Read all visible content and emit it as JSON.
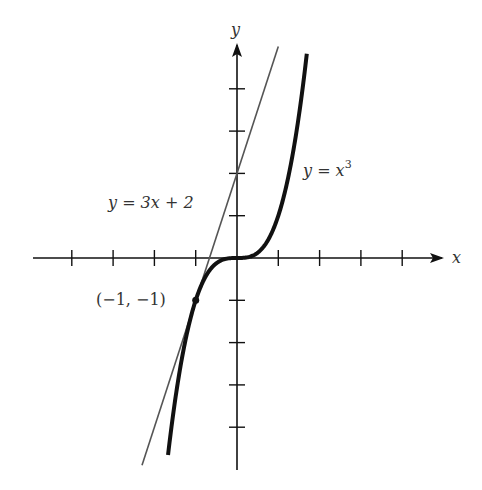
{
  "chart_data": {
    "type": "line",
    "title": "",
    "xlabel": "x",
    "ylabel": "y",
    "xlim": [
      -4.9,
      4.9
    ],
    "ylim": [
      -5.2,
      5.1
    ],
    "grid": false,
    "x_ticks": [
      -4,
      -3,
      -2,
      -1,
      1,
      2,
      3,
      4
    ],
    "y_ticks": [
      -4,
      -3,
      -2,
      -1,
      1,
      2,
      3,
      4
    ],
    "series": [
      {
        "name": "y = x^3",
        "label": "y = x",
        "superscript": "3",
        "function": "x^3",
        "x_range": [
          -1.67,
          1.69
        ],
        "style": "thick black"
      },
      {
        "name": "y = 3x + 2",
        "label": "y = 3x + 2",
        "function": "3x+2",
        "x_range": [
          -2.3,
          1.0
        ],
        "style": "thin gray"
      }
    ],
    "annotations": [
      {
        "text": "(−1, −1)",
        "point": [
          -1,
          -1
        ]
      }
    ]
  }
}
